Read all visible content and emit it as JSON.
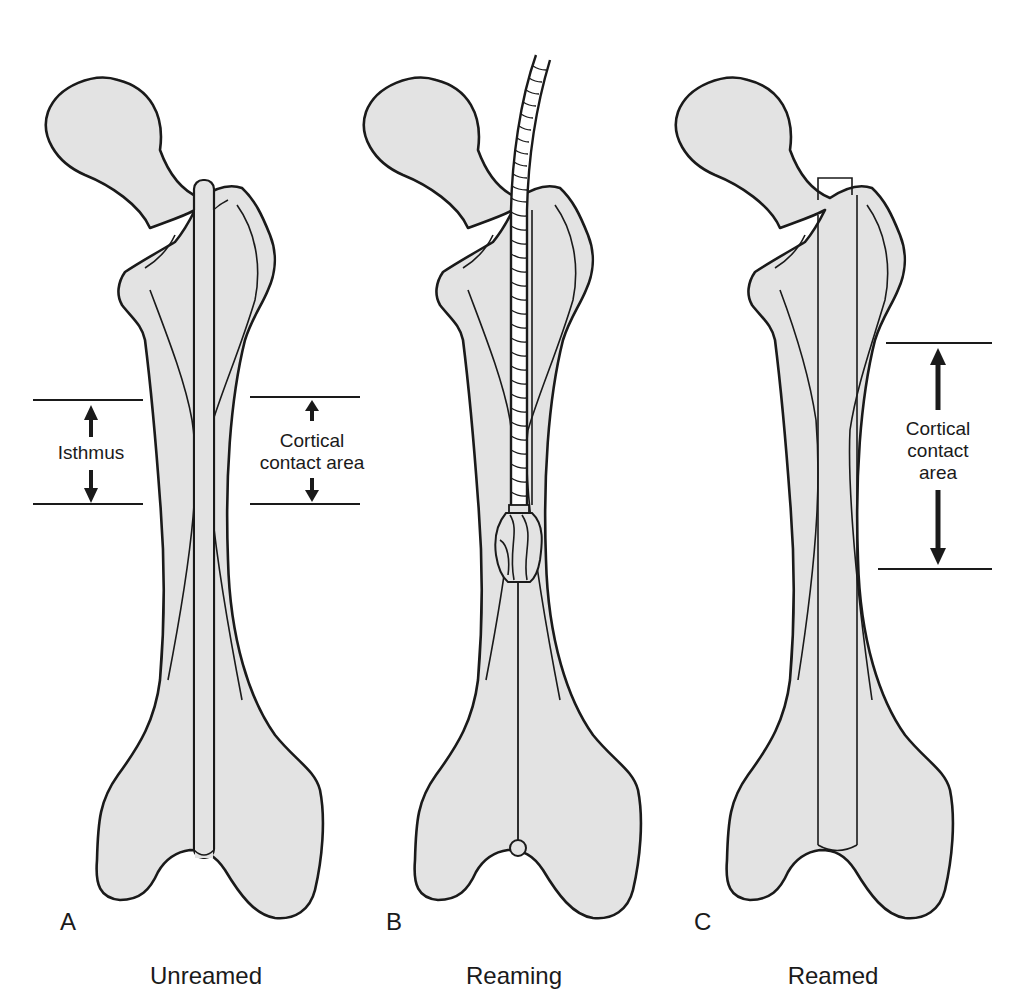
{
  "figure": {
    "panels": [
      {
        "letter": "A",
        "caption": "Unreamed"
      },
      {
        "letter": "B",
        "caption": "Reaming"
      },
      {
        "letter": "C",
        "caption": "Reamed"
      }
    ],
    "labels": {
      "isthmus": "Isthmus",
      "cortical_a_line1": "Cortical",
      "cortical_a_line2": "contact area",
      "cortical_c_line1": "Cortical",
      "cortical_c_line2": "contact",
      "cortical_c_line3": "area"
    },
    "colors": {
      "bone_fill": "#e3e3e3",
      "outline": "#1a1a1a",
      "background": "#ffffff"
    }
  }
}
